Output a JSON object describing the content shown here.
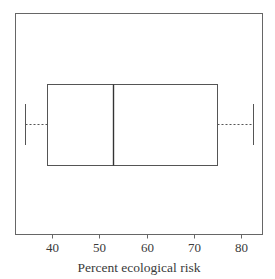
{
  "chart_data": {
    "type": "box",
    "title": "",
    "xlabel": "Percent ecological risk",
    "ylabel": "",
    "xlim": [
      32,
      84
    ],
    "xticks": [
      40,
      50,
      60,
      70,
      80
    ],
    "xtick_labels": [
      "40",
      "50",
      "60",
      "70",
      "80"
    ],
    "grid": false,
    "legend": null,
    "orientation": "horizontal",
    "series": [
      {
        "name": "Percent ecological risk",
        "min": 34.3,
        "q1": 39,
        "median": 53,
        "q3": 75,
        "max": 82.5
      }
    ],
    "style": {
      "line_color": "#555555",
      "whisker_style": "dotted",
      "background": "#ffffff"
    }
  }
}
